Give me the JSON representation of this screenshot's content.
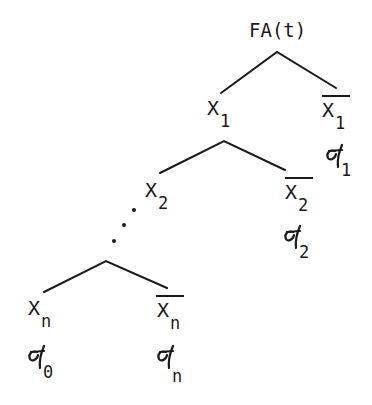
{
  "diagram": {
    "type": "fault-tree / event-tree",
    "root": {
      "label": "FA(t)"
    },
    "levels": [
      {
        "left": {
          "label": "X",
          "subscript": "1",
          "negated": false
        },
        "right": {
          "label": "X",
          "subscript": "1",
          "negated": true,
          "prob_symbol": "σ",
          "prob_subscript": "1"
        }
      },
      {
        "left": {
          "label": "X",
          "subscript": "2",
          "negated": false
        },
        "right": {
          "label": "X",
          "subscript": "2",
          "negated": true,
          "prob_symbol": "σ",
          "prob_subscript": "2"
        }
      },
      {
        "left": {
          "label": "X",
          "subscript": "n",
          "negated": false,
          "prob_symbol": "σ",
          "prob_subscript": "0"
        },
        "right": {
          "label": "X",
          "subscript": "n",
          "negated": true,
          "prob_symbol": "σ",
          "prob_subscript": "n"
        }
      }
    ],
    "ellipsis": "⋰",
    "colors": {
      "ink": "#1a1a1a",
      "background": "#ffffff"
    }
  }
}
